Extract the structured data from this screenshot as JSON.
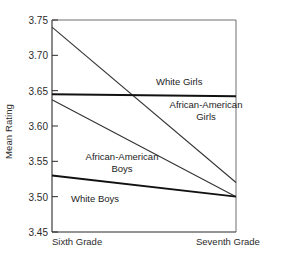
{
  "chart_data": {
    "type": "line",
    "title": "",
    "xlabel": "",
    "ylabel": "Mean Rating",
    "categories": [
      "Sixth Grade",
      "Seventh Grade"
    ],
    "x": [
      0,
      1
    ],
    "xlim": [
      0,
      1
    ],
    "ylim": [
      3.45,
      3.75
    ],
    "yticks": [
      3.45,
      3.5,
      3.55,
      3.6,
      3.65,
      3.7,
      3.75
    ],
    "ytick_labels": [
      "3.45",
      "3.50",
      "3.55",
      "3.60",
      "3.65",
      "3.70",
      "3.75"
    ],
    "grid": false,
    "legend": "inline-annotations",
    "series": [
      {
        "name": "African-American Girls",
        "values": [
          3.74,
          3.52
        ],
        "color": "#333333",
        "width": 1.1
      },
      {
        "name": "White Girls",
        "values": [
          3.645,
          3.642
        ],
        "color": "#111111",
        "width": 1.9
      },
      {
        "name": "African-American Boys",
        "values": [
          3.637,
          3.5
        ],
        "color": "#333333",
        "width": 1.1
      },
      {
        "name": "White Boys",
        "values": [
          3.53,
          3.5
        ],
        "color": "#111111",
        "width": 1.9
      }
    ],
    "annotations": [
      {
        "text": "White Girls",
        "series": "White Girls"
      },
      {
        "text": "African-American Girls",
        "series": "African-American Girls"
      },
      {
        "text": "African-American Boys",
        "series": "African-American Boys"
      },
      {
        "text": "White Boys",
        "series": "White Boys"
      }
    ]
  },
  "axis": {
    "ylabel": "Mean Rating",
    "ytick_0": "3.45",
    "ytick_1": "3.50",
    "ytick_2": "3.55",
    "ytick_3": "3.60",
    "ytick_4": "3.65",
    "ytick_5": "3.70",
    "ytick_6": "3.75",
    "xtick_left": "Sixth Grade",
    "xtick_right": "Seventh Grade"
  },
  "labels": {
    "white_girls": "White Girls",
    "aa_girls_line1": "African-American",
    "aa_girls_line2": "Girls",
    "aa_boys_line1": "African-American",
    "aa_boys_line2": "Boys",
    "white_boys": "White Boys"
  },
  "colors": {
    "axis": "#2b2b2b",
    "line_thin": "#333333",
    "line_thick": "#111111",
    "text": "#1c1c1c",
    "background": "#ffffff"
  }
}
